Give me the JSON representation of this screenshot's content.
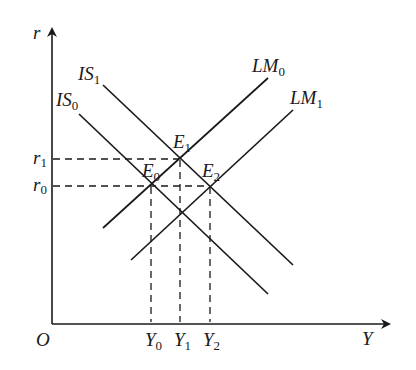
{
  "diagram": {
    "axes": {
      "y_label": "r",
      "x_label": "Y",
      "origin_label": "O"
    },
    "curves": {
      "is1": {
        "label": "IS",
        "sub": "1"
      },
      "is0": {
        "label": "IS",
        "sub": "0"
      },
      "lm0": {
        "label": "LM",
        "sub": "0"
      },
      "lm1": {
        "label": "LM",
        "sub": "1"
      }
    },
    "points": {
      "e1": {
        "label": "E",
        "sub": "1"
      },
      "e0": {
        "label": "E",
        "sub": "0"
      },
      "e2": {
        "label": "E",
        "sub": "2"
      }
    },
    "y_ticks": {
      "r1": {
        "label": "r",
        "sub": "1"
      },
      "r0": {
        "label": "r",
        "sub": "0"
      }
    },
    "x_ticks": {
      "y0": {
        "label": "Y",
        "sub": "0"
      },
      "y1": {
        "label": "Y",
        "sub": "1"
      },
      "y2": {
        "label": "Y",
        "sub": "2"
      }
    },
    "colors": {
      "line": "#1a1a1a",
      "background": "#ffffff"
    }
  }
}
